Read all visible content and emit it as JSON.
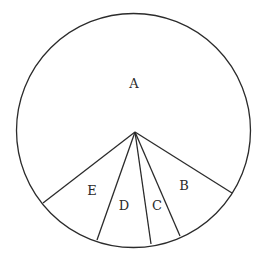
{
  "diagram": {
    "type": "pie-sector-diagram",
    "colors": {
      "stroke": "#2b2b2b",
      "fill": "#ffffff",
      "label": "#2a2a2a"
    },
    "circle": {
      "cx": 133.5,
      "cy": 130.5,
      "r": 117
    },
    "center_point": {
      "x": 135,
      "y": 132
    },
    "spokes": [
      {
        "name": "spoke-e-left",
        "x2": 43,
        "y2": 203
      },
      {
        "name": "spoke-d-left",
        "x2": 97,
        "y2": 240
      },
      {
        "name": "spoke-c-left",
        "x2": 151,
        "y2": 244
      },
      {
        "name": "spoke-b-left",
        "x2": 180,
        "y2": 236
      },
      {
        "name": "spoke-b-right",
        "x2": 232,
        "y2": 193
      }
    ],
    "sectors": [
      {
        "label": "A",
        "x": 134,
        "y": 88,
        "approx_angle_deg": 250
      },
      {
        "label": "B",
        "x": 184,
        "y": 190,
        "approx_angle_deg": 34
      },
      {
        "label": "C",
        "x": 157,
        "y": 210,
        "approx_angle_deg": 15
      },
      {
        "label": "D",
        "x": 124,
        "y": 210,
        "approx_angle_deg": 28
      },
      {
        "label": "E",
        "x": 92,
        "y": 195,
        "approx_angle_deg": 33
      }
    ]
  },
  "chart_data": {
    "type": "pie",
    "title": "",
    "categories": [
      "A",
      "B",
      "C",
      "D",
      "E"
    ],
    "values": [
      69.4,
      9.6,
      4.3,
      7.6,
      9.1
    ],
    "units": "approx. percent of circle (estimated from sector angles)",
    "legend": "none (labels inside sectors)"
  }
}
